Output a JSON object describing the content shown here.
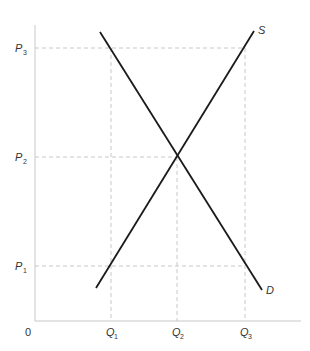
{
  "chart_data": {
    "type": "line",
    "title": "",
    "xlabel": "",
    "ylabel": "",
    "origin_label": "0",
    "x_ticks": [
      {
        "label": "Q",
        "sub": "1",
        "x": 111
      },
      {
        "label": "Q",
        "sub": "2",
        "x": 177
      },
      {
        "label": "Q",
        "sub": "3",
        "x": 245
      }
    ],
    "y_ticks": [
      {
        "label": "P",
        "sub": "3",
        "y": 48
      },
      {
        "label": "P",
        "sub": "2",
        "y": 157
      },
      {
        "label": "P",
        "sub": "1",
        "y": 266
      }
    ],
    "series": [
      {
        "name": "S",
        "label": "S",
        "points": [
          [
            96,
            288
          ],
          [
            254,
            31
          ]
        ]
      },
      {
        "name": "D",
        "label": "D",
        "points": [
          [
            100,
            32
          ],
          [
            262,
            290
          ]
        ]
      }
    ],
    "equilibrium": {
      "x_label": "Q2",
      "y_label": "P2"
    },
    "colors": {
      "curve": "#1a1a1a",
      "axis": "#c8c8c8",
      "guide": "#c8c8c8",
      "text": "#333333"
    }
  }
}
